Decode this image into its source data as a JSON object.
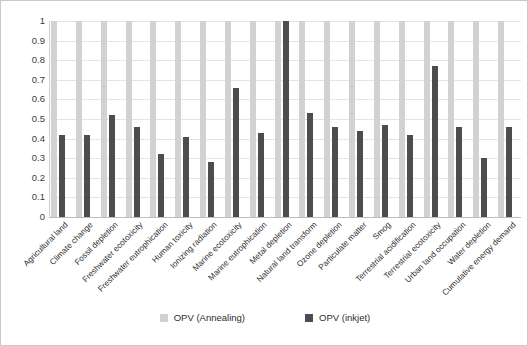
{
  "chart_data": {
    "type": "bar",
    "title": "",
    "subtitle": "",
    "xlabel": "",
    "ylabel": "",
    "ylim": [
      0,
      1
    ],
    "ytick_labels": [
      "1",
      "0.9",
      "0.8",
      "0.7",
      "0.6",
      "0.5",
      "0.4",
      "0.3",
      "0.2",
      "0.1",
      "0"
    ],
    "ytick_values": [
      1,
      0.9,
      0.8,
      0.7,
      0.6,
      0.5,
      0.4,
      0.3,
      0.2,
      0.1,
      0
    ],
    "grid": true,
    "legend_position": "bottom",
    "categories": [
      "Agricultural land",
      "Climate change",
      "Fossil depletion",
      "Freshwater ecotoxicity",
      "Freshwater eutrophication",
      "Human toxicity",
      "Ionizing radiation",
      "Marine ecotoxicity",
      "Marine eutrophication",
      "Metal depletion",
      "Natural land transform",
      "Ozone depletion",
      "Particulate matter",
      "Smog",
      "Terrestrial acidification",
      "Terrestrial ecotoxicity",
      "Urban land occupation",
      "Water depletion",
      "Cumulative energy demand"
    ],
    "series": [
      {
        "name": "OPV (Annealing)",
        "color": "#d2d2d2",
        "values": [
          1,
          1,
          1,
          1,
          1,
          1,
          1,
          1,
          1,
          1,
          1,
          1,
          1,
          1,
          1,
          1,
          1,
          1,
          1
        ]
      },
      {
        "name": "OPV (inkjet)",
        "color": "#4d4d4d",
        "values": [
          0.42,
          0.42,
          0.52,
          0.46,
          0.32,
          0.41,
          0.28,
          0.66,
          0.43,
          1.0,
          0.53,
          0.46,
          0.44,
          0.47,
          0.42,
          0.77,
          0.46,
          0.3,
          0.46
        ]
      }
    ]
  },
  "legend": {
    "items": [
      {
        "label": "OPV (Annealing)",
        "color": "#d2d2d2"
      },
      {
        "label": "OPV (inkjet)",
        "color": "#4d4d4d"
      }
    ]
  }
}
